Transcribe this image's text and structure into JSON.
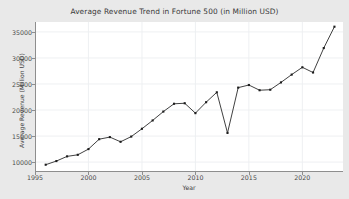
{
  "chart_data": {
    "type": "line",
    "title": "Average Revenue Trend in Fortune 500 (in Million USD)",
    "xlabel": "Year",
    "ylabel": "Average Revenue (Million USD)",
    "xlim": [
      1995.0,
      2023.8
    ],
    "ylim": [
      8100,
      36900
    ],
    "xticks": [
      1995,
      2000,
      2005,
      2010,
      2015,
      2020
    ],
    "xtick_labels": [
      "1995",
      "2000",
      "2005",
      "2010",
      "2015",
      "2020"
    ],
    "yticks": [
      10000,
      15000,
      20000,
      25000,
      30000,
      35000
    ],
    "ytick_labels": [
      "10000",
      "15000",
      "20000",
      "25000",
      "30000",
      "35000"
    ],
    "grid": true,
    "legend": false,
    "marker": "square",
    "line_color": "#2b2b2b",
    "marker_color": "#1c1c1c",
    "plot_background": "#ffffff",
    "figure_background": "#e9e9e9",
    "grid_color": "#eceef1",
    "x": [
      1996,
      1997,
      1998,
      1999,
      2000,
      2001,
      2002,
      2003,
      2004,
      2005,
      2006,
      2007,
      2008,
      2009,
      2010,
      2011,
      2012,
      2013,
      2014,
      2015,
      2016,
      2017,
      2018,
      2019,
      2020,
      2021,
      2022,
      2023
    ],
    "values": [
      9500,
      10200,
      11100,
      11400,
      12500,
      14400,
      14800,
      13900,
      14900,
      16400,
      18000,
      19700,
      21200,
      21300,
      19400,
      21500,
      23400,
      15600,
      24300,
      24800,
      23800,
      23900,
      25300,
      26800,
      28200,
      27200,
      31900,
      36000
    ]
  }
}
